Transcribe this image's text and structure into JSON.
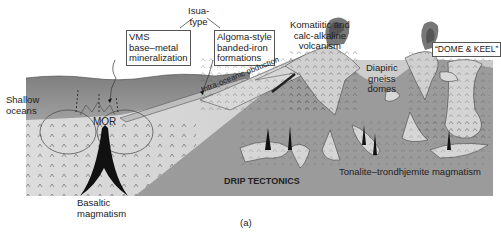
{
  "figure": {
    "panel_label": "(a)",
    "labels": {
      "isua_type": [
        "Isua-",
        "type"
      ],
      "vms": [
        "VMS",
        "base–metal",
        "mineralization"
      ],
      "algoma": [
        "Algoma-style",
        "banded-iron",
        "formations"
      ],
      "shallow_oceans": [
        "Shallow",
        "oceans"
      ],
      "mor": "MOR",
      "intra_oceanic_obduction": "Intra-oceanic obduction",
      "komatiitic": [
        "Komatiitic and",
        "calc-alkaline",
        "volcanism"
      ],
      "dome_keel": "“DOME & KEEL”",
      "diapiric": [
        "Diapiric",
        "gneiss",
        "domes"
      ],
      "drip_tectonics": "DRIP TECTONICS",
      "tonalite": "Tonalite–trondhjemite magmatism",
      "basaltic": [
        "Basaltic",
        "magmatism"
      ]
    },
    "colors": {
      "ocean": "#8c8c8c",
      "oceanic_crust": "#d4d4d4",
      "continental": "#9a9a9a",
      "greenstone": "#cfcfcf",
      "magma": "#111111"
    }
  }
}
